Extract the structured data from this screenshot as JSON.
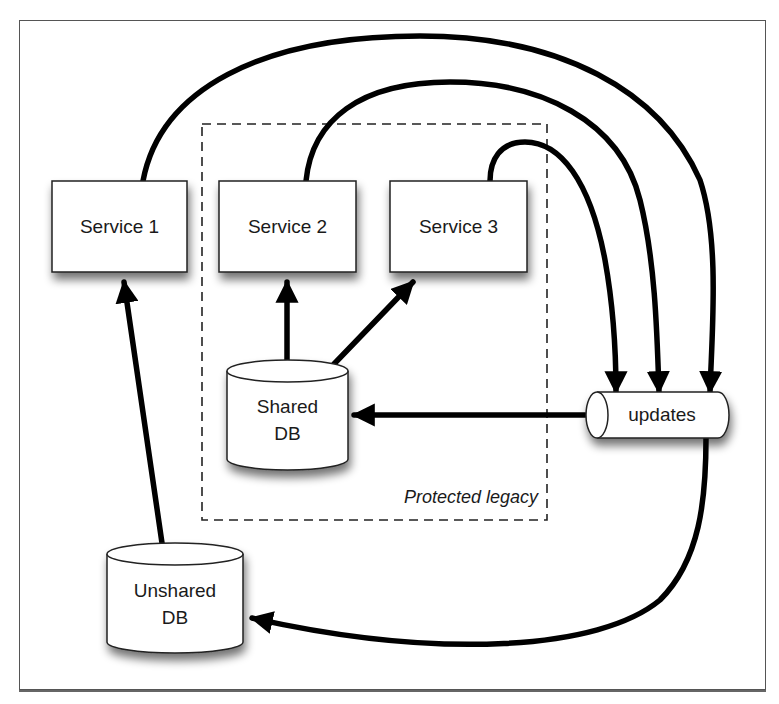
{
  "diagram": {
    "nodes": {
      "service1": {
        "label": "Service 1"
      },
      "service2": {
        "label": "Service 2"
      },
      "service3": {
        "label": "Service 3"
      },
      "shared_db": {
        "line1": "Shared",
        "line2": "DB"
      },
      "unshared_db": {
        "line1": "Unshared",
        "line2": "DB"
      },
      "updates": {
        "label": "updates"
      }
    },
    "groups": {
      "protected_legacy": {
        "label": "Protected legacy"
      }
    },
    "edges": [
      {
        "from": "Shared DB",
        "to": "Service 2"
      },
      {
        "from": "Shared DB",
        "to": "Service 3"
      },
      {
        "from": "Unshared DB",
        "to": "Service 1"
      },
      {
        "from": "Service 1",
        "to": "updates"
      },
      {
        "from": "Service 2",
        "to": "updates"
      },
      {
        "from": "Service 3",
        "to": "updates"
      },
      {
        "from": "updates",
        "to": "Shared DB"
      },
      {
        "from": "updates",
        "to": "Unshared DB"
      }
    ],
    "colors": {
      "stroke": "#000000",
      "node_fill": "#ffffff",
      "frame": "#555555",
      "text": "#1a1a1a"
    }
  }
}
